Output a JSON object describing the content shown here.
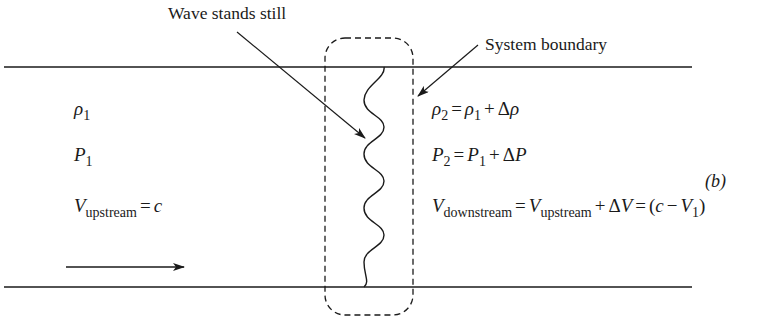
{
  "figure": {
    "panel_label": "(b)",
    "annotations": {
      "wave_label": "Wave stands still",
      "boundary_label": "System boundary"
    },
    "upstream": {
      "density": {
        "symbol": "ρ",
        "sub": "1"
      },
      "pressure": {
        "symbol": "P",
        "sub": "1"
      },
      "velocity": {
        "symbol": "V",
        "sub": "upstream",
        "eq": "=",
        "rhs": "c"
      }
    },
    "downstream": {
      "density": {
        "lhs": "ρ",
        "lhs_sub": "2",
        "eq": "=",
        "t1": "ρ",
        "t1_sub": "1",
        "plus": "+",
        "delta": "Δ",
        "t2": "ρ"
      },
      "pressure": {
        "lhs": "P",
        "lhs_sub": "2",
        "eq": "=",
        "t1": "P",
        "t1_sub": "1",
        "plus": "+",
        "delta": "Δ",
        "t2": "P"
      },
      "velocity": {
        "lhs": "V",
        "lhs_sub": "downstream",
        "eq": "=",
        "t1": "V",
        "t1_sub": "upstream",
        "plus": "+",
        "delta": "Δ",
        "t2": "V",
        "eq2": "=",
        "open": "(",
        "c": "c",
        "minus": "−",
        "t3": "V",
        "t3_sub": "1",
        "close": ")"
      }
    },
    "colors": {
      "ink": "#1a1a1a",
      "background": "#ffffff"
    }
  }
}
